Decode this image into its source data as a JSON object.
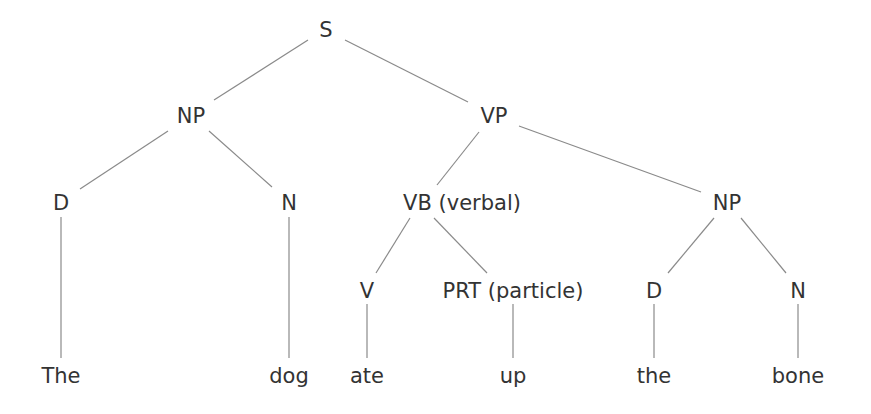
{
  "diagram": {
    "type": "syntax-tree",
    "colors": {
      "text": "#333333",
      "edge": "#8a8a8a",
      "background": "#ffffff"
    },
    "nodes": [
      {
        "id": "S",
        "label": "S",
        "x": 326,
        "y": 30
      },
      {
        "id": "NP1",
        "label": "NP",
        "x": 191,
        "y": 116
      },
      {
        "id": "VP",
        "label": "VP",
        "x": 494,
        "y": 116
      },
      {
        "id": "D1",
        "label": "D",
        "x": 61,
        "y": 203
      },
      {
        "id": "N1",
        "label": "N",
        "x": 289,
        "y": 203
      },
      {
        "id": "VB",
        "label": "VB (verbal)",
        "x": 462,
        "y": 203
      },
      {
        "id": "NP2",
        "label": "NP",
        "x": 727,
        "y": 203
      },
      {
        "id": "V",
        "label": "V",
        "x": 367,
        "y": 291
      },
      {
        "id": "PRT",
        "label": "PRT (particle)",
        "x": 513,
        "y": 291
      },
      {
        "id": "D2",
        "label": "D",
        "x": 654,
        "y": 291
      },
      {
        "id": "N2",
        "label": "N",
        "x": 798,
        "y": 291
      },
      {
        "id": "w_The",
        "label": "The",
        "x": 61,
        "y": 376
      },
      {
        "id": "w_dog",
        "label": "dog",
        "x": 289,
        "y": 376
      },
      {
        "id": "w_ate",
        "label": "ate",
        "x": 367,
        "y": 376
      },
      {
        "id": "w_up",
        "label": "up",
        "x": 513,
        "y": 376
      },
      {
        "id": "w_the",
        "label": "the",
        "x": 654,
        "y": 376
      },
      {
        "id": "w_bone",
        "label": "bone",
        "x": 798,
        "y": 376
      }
    ],
    "edges": [
      {
        "from": "S",
        "to": "NP1",
        "x1": 308,
        "y1": 40,
        "x2": 214,
        "y2": 100
      },
      {
        "from": "S",
        "to": "VP",
        "x1": 345,
        "y1": 40,
        "x2": 468,
        "y2": 102
      },
      {
        "from": "NP1",
        "to": "D1",
        "x1": 168,
        "y1": 131,
        "x2": 80,
        "y2": 189
      },
      {
        "from": "NP1",
        "to": "N1",
        "x1": 209,
        "y1": 131,
        "x2": 272,
        "y2": 187
      },
      {
        "from": "VP",
        "to": "VB",
        "x1": 479,
        "y1": 132,
        "x2": 437,
        "y2": 185
      },
      {
        "from": "VP",
        "to": "NP2",
        "x1": 519,
        "y1": 126,
        "x2": 701,
        "y2": 192
      },
      {
        "from": "D1",
        "to": "w_The",
        "x1": 61,
        "y1": 217,
        "x2": 61,
        "y2": 358
      },
      {
        "from": "N1",
        "to": "w_dog",
        "x1": 289,
        "y1": 217,
        "x2": 289,
        "y2": 358
      },
      {
        "from": "VB",
        "to": "V",
        "x1": 410,
        "y1": 218,
        "x2": 376,
        "y2": 273
      },
      {
        "from": "VB",
        "to": "PRT",
        "x1": 434,
        "y1": 218,
        "x2": 487,
        "y2": 273
      },
      {
        "from": "NP2",
        "to": "D2",
        "x1": 714,
        "y1": 218,
        "x2": 668,
        "y2": 273
      },
      {
        "from": "NP2",
        "to": "N2",
        "x1": 741,
        "y1": 218,
        "x2": 786,
        "y2": 273
      },
      {
        "from": "V",
        "to": "w_ate",
        "x1": 367,
        "y1": 304,
        "x2": 367,
        "y2": 358
      },
      {
        "from": "PRT",
        "to": "w_up",
        "x1": 513,
        "y1": 304,
        "x2": 513,
        "y2": 358
      },
      {
        "from": "D2",
        "to": "w_the",
        "x1": 654,
        "y1": 304,
        "x2": 654,
        "y2": 358
      },
      {
        "from": "N2",
        "to": "w_bone",
        "x1": 798,
        "y1": 304,
        "x2": 798,
        "y2": 358
      }
    ]
  }
}
